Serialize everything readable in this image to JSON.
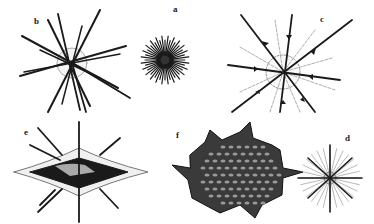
{
  "figure": {
    "panels": [
      {
        "id": "a",
        "label": "a",
        "type": "dense spiny sphere"
      },
      {
        "id": "b",
        "label": "b",
        "type": "long radiating spicules"
      },
      {
        "id": "c",
        "label": "c",
        "type": "arrow-tipped spines with fine rays"
      },
      {
        "id": "d",
        "label": "d",
        "type": "small star with fine rays"
      },
      {
        "id": "e",
        "label": "e",
        "type": "lens-shaped body with spines"
      },
      {
        "id": "f",
        "label": "f",
        "type": "textured spiky body"
      }
    ]
  },
  "colors": {
    "ink": "#1a1a1a",
    "background": "#ffffff",
    "light": "#777777"
  }
}
